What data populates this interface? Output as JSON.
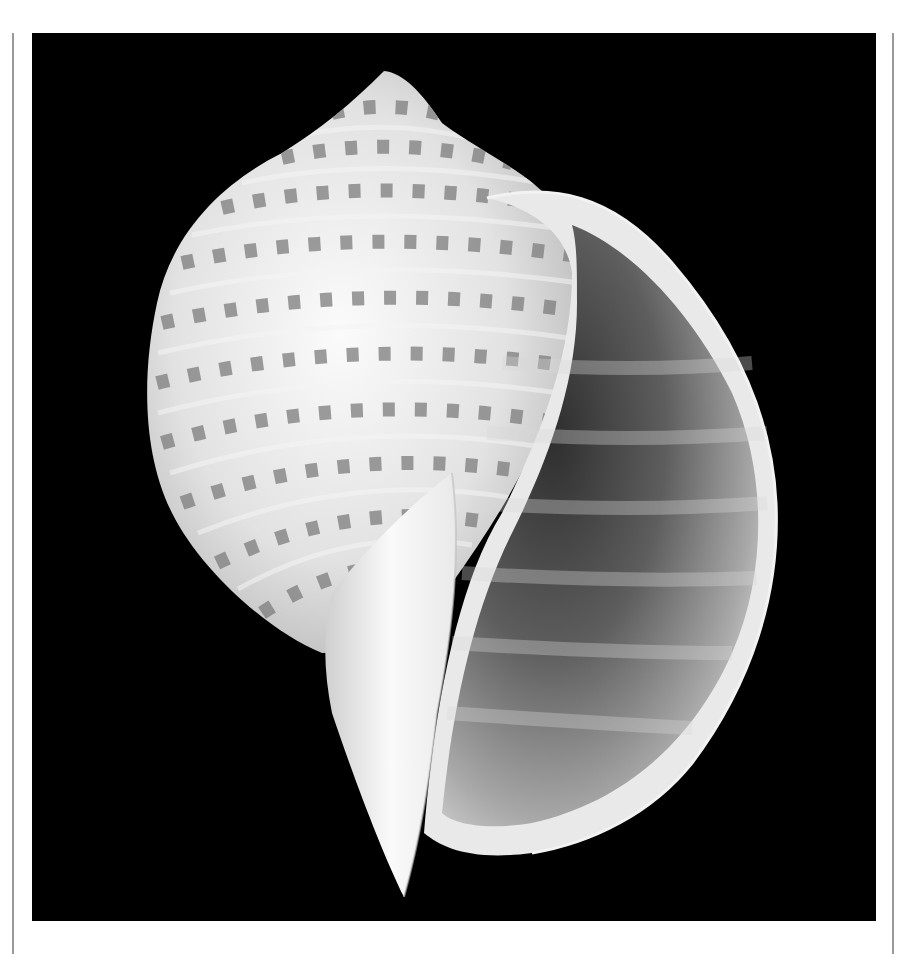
{
  "page": {
    "background": "#ffffff",
    "rule_color": "#9a9a9a"
  },
  "photo": {
    "alt": "Tonna shell (tun shell) photographed against a black background",
    "subject": "seashell",
    "background_color": "#000000",
    "shell_colors": {
      "body": "#e6e6e6",
      "highlight": "#fbfbfb",
      "spot": "#7c7c7c",
      "aperture_dark": "#3a3a3a",
      "aperture_mid": "#9a9a9a"
    }
  }
}
